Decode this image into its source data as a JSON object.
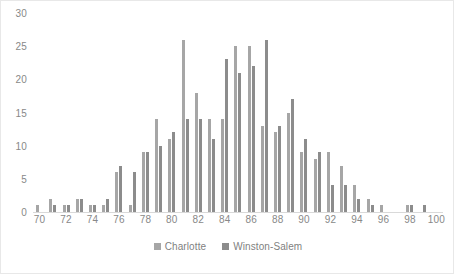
{
  "chart_data": {
    "type": "bar",
    "title": "",
    "subtitle": "",
    "xlabel": "",
    "ylabel": "",
    "xlim": [
      69.5,
      100.5
    ],
    "ylim": [
      0,
      30
    ],
    "ytick_values": [
      0,
      5,
      10,
      15,
      20,
      25,
      30
    ],
    "ytick_labels": [
      "0",
      "5",
      "10",
      "15",
      "20",
      "25",
      "30"
    ],
    "xtick_labels": [
      "70",
      "72",
      "74",
      "76",
      "78",
      "80",
      "82",
      "84",
      "86",
      "88",
      "90",
      "92",
      "94",
      "96",
      "98",
      "100"
    ],
    "categories": [
      70,
      71,
      72,
      73,
      74,
      75,
      76,
      77,
      78,
      79,
      80,
      81,
      82,
      83,
      84,
      85,
      86,
      87,
      88,
      89,
      90,
      91,
      92,
      93,
      94,
      95,
      96,
      97,
      98,
      99,
      100
    ],
    "grid": false,
    "legend_position": "bottom",
    "colors": {
      "series_0": "#a6a6a6",
      "series_1": "#8c8c8c",
      "axis_text": "#888888",
      "axis_line": "#d9d9d9",
      "legend_text": "#7f7f7f",
      "background": "#ffffff",
      "border": "#e8e8e8"
    },
    "series": [
      {
        "name": "Charlotte",
        "color": "#a6a6a6",
        "values": [
          1,
          2,
          1,
          2,
          1,
          1,
          6,
          1,
          9,
          14,
          11,
          26,
          18,
          14,
          14,
          25,
          25,
          13,
          12,
          15,
          9,
          8,
          9,
          7,
          4,
          2,
          1,
          0,
          1,
          0,
          0
        ]
      },
      {
        "name": "Winston-Salem",
        "color": "#8c8c8c",
        "values": [
          0,
          1,
          1,
          2,
          1,
          2,
          7,
          6,
          9,
          10,
          12,
          14,
          14,
          11,
          23,
          21,
          22,
          26,
          13,
          17,
          11,
          9,
          4,
          4,
          2,
          1,
          0,
          0,
          1,
          1,
          0
        ]
      }
    ]
  },
  "legend": {
    "items": [
      {
        "label": "Charlotte"
      },
      {
        "label": "Winston-Salem"
      }
    ]
  }
}
